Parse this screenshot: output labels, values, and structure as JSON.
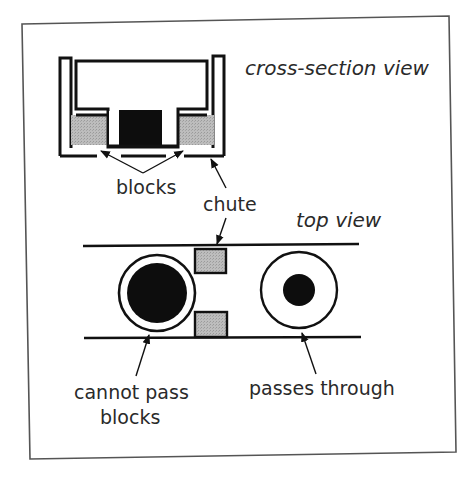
{
  "diagram": {
    "labels": {
      "cross_section": "cross-section view",
      "top_view": "top view",
      "blocks": "blocks",
      "chute": "chute",
      "cannot_pass_line1": "cannot pass",
      "cannot_pass_line2": "blocks",
      "passes_through": "passes through"
    },
    "colors": {
      "stroke": "#111111",
      "frame": "#555555",
      "block_fill": "#b8b8b8",
      "solid_fill": "#0d0d0d",
      "background": "#ffffff",
      "text": "#2a2a2a"
    },
    "elements": {
      "cross_section": [
        "chute (U-shaped channel)",
        "upper white body",
        "black core",
        "two gray blocks"
      ],
      "top_view": [
        "chute rails (two parallel lines)",
        "two gray blocks",
        "large-core disc (cannot pass blocks)",
        "small-core disc (passes through)"
      ]
    }
  }
}
